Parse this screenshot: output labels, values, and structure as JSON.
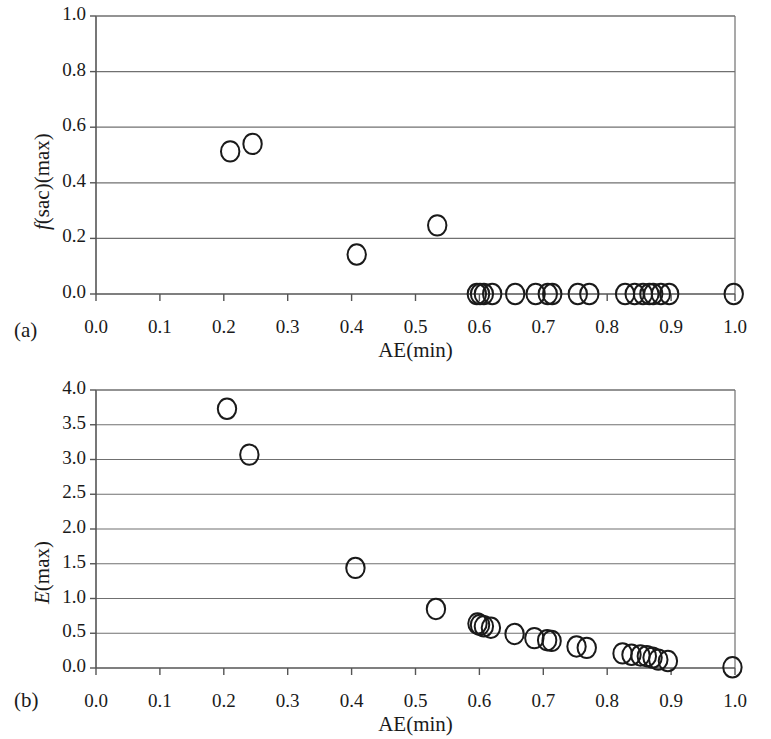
{
  "figure": {
    "panels": [
      {
        "tag": "(a)",
        "xlabel": "AE(min)",
        "ylabel_parts": {
          "italic": "f",
          "rest": "(sac)(max)"
        },
        "ylabel": "f(sac)(max)"
      },
      {
        "tag": "(b)",
        "xlabel": "AE(min)",
        "ylabel_parts": {
          "italic": "E",
          "rest": "(max)"
        },
        "ylabel": "E(max)"
      }
    ]
  },
  "chart_data": [
    {
      "type": "scatter",
      "panel": "(a)",
      "title": "",
      "xlabel": "AE(min)",
      "ylabel": "f(sac)(max)",
      "xlim": [
        0.0,
        1.0
      ],
      "ylim": [
        0.0,
        1.0
      ],
      "xticks": [
        "0.0",
        "0.1",
        "0.2",
        "0.3",
        "0.4",
        "0.5",
        "0.6",
        "0.7",
        "0.8",
        "0.9",
        "1.0"
      ],
      "xtick_values": [
        0.0,
        0.1,
        0.2,
        0.3,
        0.4,
        0.5,
        0.6,
        0.7,
        0.8,
        0.9,
        1.0
      ],
      "yticks": [
        "0.0",
        "0.2",
        "0.4",
        "0.6",
        "0.8",
        "1.0"
      ],
      "ytick_values": [
        0.0,
        0.2,
        0.4,
        0.6,
        0.8,
        1.0
      ],
      "grid": "horizontal",
      "marker": "open-circle",
      "legend": "none",
      "x": [
        0.21,
        0.245,
        0.408,
        0.534,
        0.596,
        0.601,
        0.607,
        0.62,
        0.656,
        0.688,
        0.707,
        0.714,
        0.754,
        0.772,
        0.828,
        0.843,
        0.856,
        0.866,
        0.872,
        0.884,
        0.897,
        0.998
      ],
      "y": [
        0.513,
        0.54,
        0.142,
        0.247,
        0.0,
        0.0,
        0.0,
        0.0,
        0.0,
        0.0,
        0.0,
        0.0,
        0.0,
        0.0,
        0.0,
        0.0,
        0.0,
        0.0,
        0.0,
        0.0,
        0.0,
        0.0
      ]
    },
    {
      "type": "scatter",
      "panel": "(b)",
      "title": "",
      "xlabel": "AE(min)",
      "ylabel": "E(max)",
      "xlim": [
        0.0,
        1.0
      ],
      "ylim": [
        0.0,
        4.0
      ],
      "xticks": [
        "0.0",
        "0.1",
        "0.2",
        "0.3",
        "0.4",
        "0.5",
        "0.6",
        "0.7",
        "0.8",
        "0.9",
        "1.0"
      ],
      "xtick_values": [
        0.0,
        0.1,
        0.2,
        0.3,
        0.4,
        0.5,
        0.6,
        0.7,
        0.8,
        0.9,
        1.0
      ],
      "yticks": [
        "0.0",
        "0.5",
        "1.0",
        "1.5",
        "2.0",
        "2.5",
        "3.0",
        "3.5",
        "4.0"
      ],
      "ytick_values": [
        0.0,
        0.5,
        1.0,
        1.5,
        2.0,
        2.5,
        3.0,
        3.5,
        4.0
      ],
      "grid": "horizontal",
      "marker": "open-circle",
      "legend": "none",
      "x": [
        0.205,
        0.24,
        0.406,
        0.532,
        0.597,
        0.601,
        0.607,
        0.618,
        0.655,
        0.686,
        0.706,
        0.713,
        0.752,
        0.768,
        0.824,
        0.838,
        0.852,
        0.862,
        0.871,
        0.88,
        0.895,
        0.996
      ],
      "y": [
        3.73,
        3.07,
        1.44,
        0.85,
        0.64,
        0.62,
        0.6,
        0.58,
        0.49,
        0.43,
        0.4,
        0.39,
        0.31,
        0.29,
        0.21,
        0.19,
        0.18,
        0.17,
        0.15,
        0.12,
        0.1,
        0.01
      ]
    }
  ]
}
